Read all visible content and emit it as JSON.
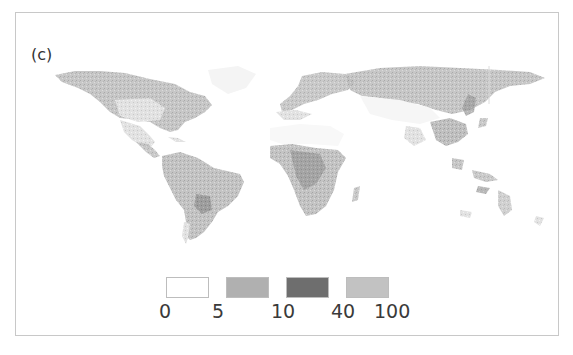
{
  "figure": {
    "panel_label": "(c)",
    "legend": {
      "bins": [
        {
          "from": "0",
          "to": "5",
          "color": "#ffffff"
        },
        {
          "from": "5",
          "to": "10",
          "color": "#b0b0b0"
        },
        {
          "from": "10",
          "to": "40",
          "color": "#6e6e6e"
        },
        {
          "from": "40",
          "to": "100",
          "color": "#c2c2c2"
        }
      ],
      "ticks": [
        "0",
        "5",
        "10",
        "40",
        "100"
      ]
    },
    "map": {
      "type": "world choropleth",
      "regions": [
        "North America",
        "South America",
        "Europe",
        "Africa",
        "Asia",
        "Oceania"
      ]
    }
  }
}
